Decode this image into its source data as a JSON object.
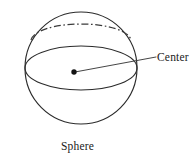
{
  "figure": {
    "name": "sphere-diagram",
    "caption": "Sphere",
    "background_color": "#ffffff",
    "line_color": "#2b2b2b",
    "annotations": {
      "center_label": "Center",
      "caption_label": "Sphere"
    },
    "geometry": {
      "sphere_outline": {
        "shape": "circle",
        "center_x": 81,
        "center_y": 68,
        "radius": 56,
        "style": "solid"
      },
      "equator_ellipse": {
        "shape": "ellipse",
        "center_x": 81,
        "center_y": 68,
        "radius_x": 56,
        "radius_y": 22,
        "style": "solid"
      },
      "upper_circle_hidden_arc": {
        "shape": "ellipse-arc",
        "center_x": 81,
        "center_y": 38,
        "radius_x": 51,
        "radius_y": 14,
        "style": "dash-dot"
      },
      "center_point": {
        "shape": "dot",
        "x": 74,
        "y": 72,
        "radius": 2.6
      },
      "leader_line": {
        "shape": "line",
        "x1": 74,
        "y1": 72,
        "x2": 156,
        "y2": 57
      }
    }
  }
}
